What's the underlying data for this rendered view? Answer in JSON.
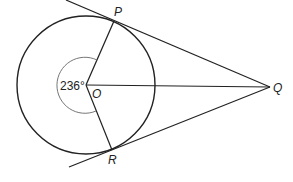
{
  "diagram": {
    "type": "circle-tangents",
    "points": {
      "O": {
        "label": "O",
        "x": 86,
        "y": 85
      },
      "P": {
        "label": "P",
        "x": 114,
        "y": 21
      },
      "R": {
        "label": "R",
        "x": 112,
        "y": 150
      },
      "Q": {
        "label": "Q",
        "x": 270,
        "y": 87
      }
    },
    "circle": {
      "center": "O",
      "radius": 69
    },
    "angle": {
      "label": "236°",
      "vertex": "O",
      "between": [
        "P",
        "R"
      ],
      "reflex": true
    },
    "colors": {
      "stroke": "#222222",
      "arc": "#666666"
    }
  }
}
